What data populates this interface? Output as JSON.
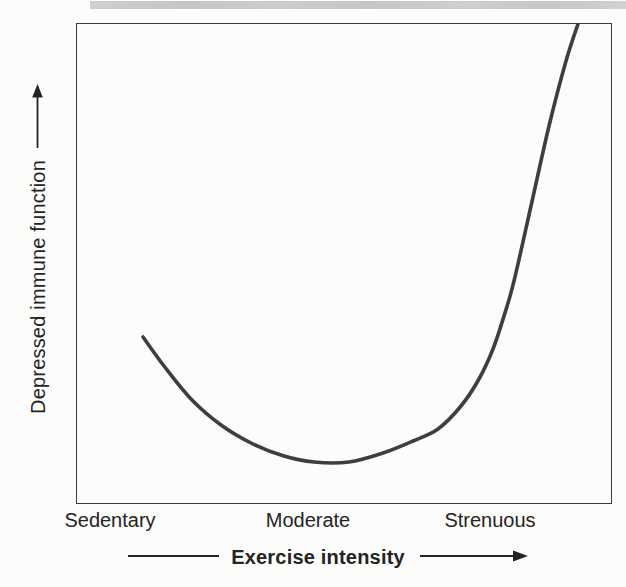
{
  "figure": {
    "colors": {
      "bg": "#fcfcfa",
      "ink": "#242424",
      "frame": "#3a3a3a",
      "curve": "#3e3e3e",
      "band": "#c7c7c7"
    }
  },
  "chart_data": {
    "type": "line",
    "title": "",
    "xlabel": "Exercise intensity",
    "ylabel": "Depressed immune function",
    "x_categories": [
      "Sedentary",
      "Moderate",
      "Strenuous"
    ],
    "axes": {
      "frame": true,
      "ticks": false,
      "grid": false,
      "numeric_scales": false,
      "axis_arrows": "both axes labeled with arrows indicating increasing direction"
    },
    "curve_shape": "J-shaped (U-curve with a steep right arm)",
    "series": [
      {
        "name": "Depressed immune function",
        "x": [
          "Sedentary",
          "Moderate",
          "Strenuous"
        ],
        "qualitative_values": [
          "moderately elevated",
          "lowest",
          "sharply elevated, rising off scale"
        ],
        "relative_values": [
          0.38,
          0.08,
          1.0
        ]
      }
    ],
    "plot_size": [
      534,
      479
    ],
    "curve_color": "#3e3e3e",
    "curve_width": 3.6,
    "curve_points_px": [
      [
        66,
        313
      ],
      [
        87,
        342
      ],
      [
        114,
        375
      ],
      [
        144,
        401
      ],
      [
        176,
        420
      ],
      [
        207,
        432
      ],
      [
        237,
        438
      ],
      [
        272,
        438
      ],
      [
        306,
        429
      ],
      [
        336,
        417
      ],
      [
        361,
        405
      ],
      [
        384,
        382
      ],
      [
        402,
        355
      ],
      [
        416,
        325
      ],
      [
        427,
        292
      ],
      [
        437,
        257
      ],
      [
        454,
        182
      ],
      [
        472,
        102
      ],
      [
        489,
        37
      ],
      [
        501,
        0
      ]
    ]
  }
}
